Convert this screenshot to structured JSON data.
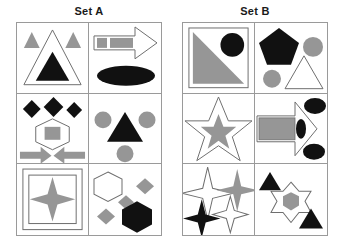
{
  "colors": {
    "black": "#111111",
    "gray": "#969696",
    "white": "#ffffff",
    "stroke": "#6e6e6e",
    "grid_line": "#9a9a9a",
    "title_text": "#1a1a1a",
    "background": "#ffffff"
  },
  "sets": [
    {
      "id": "set-a",
      "title": "Set A",
      "cells": [
        {
          "position": "row1-col1",
          "shapes": [
            "gray-triangle-small-left",
            "gray-triangle-small-right",
            "white-triangle-large-outline",
            "black-triangle-medium"
          ]
        },
        {
          "position": "row1-col2",
          "shapes": [
            "white-arrow-right-outline",
            "gray-rectangle-small",
            "gray-rectangle-wide",
            "black-ellipse"
          ]
        },
        {
          "position": "row2-col1",
          "shapes": [
            "black-diamond-left",
            "black-diamond-top",
            "black-diamond-right",
            "white-hexagon-outline",
            "gray-square",
            "gray-arrow-right",
            "gray-arrow-left"
          ]
        },
        {
          "position": "row2-col2",
          "shapes": [
            "gray-circle-left",
            "gray-circle-right",
            "black-triangle-large",
            "gray-circle-bottom"
          ]
        },
        {
          "position": "row3-col1",
          "shapes": [
            "white-square-outline-outer",
            "white-square-outline-inner",
            "gray-four-point-star"
          ]
        },
        {
          "position": "row3-col2",
          "shapes": [
            "white-hexagon-outline",
            "gray-diamond-right",
            "gray-diamond-center",
            "gray-diamond-left",
            "black-hexagon"
          ]
        }
      ]
    },
    {
      "id": "set-b",
      "title": "Set B",
      "cells": [
        {
          "position": "row1-col1",
          "shapes": [
            "white-square-outline",
            "gray-right-triangle",
            "black-circle"
          ]
        },
        {
          "position": "row1-col2",
          "shapes": [
            "black-pentagon",
            "gray-circle-right",
            "gray-circle-left",
            "white-triangle-outline"
          ]
        },
        {
          "position": "row2-col1",
          "shapes": [
            "white-five-point-star-outline",
            "gray-five-point-star"
          ]
        },
        {
          "position": "row2-col2",
          "shapes": [
            "white-arrow-right-outline",
            "gray-rectangle",
            "black-ellipse-top",
            "black-ellipse-middle",
            "black-ellipse-bottom"
          ]
        },
        {
          "position": "row3-col1",
          "shapes": [
            "white-four-point-star-outline",
            "gray-four-point-star",
            "black-four-point-star",
            "white-four-point-star-small-outline"
          ]
        },
        {
          "position": "row3-col2",
          "shapes": [
            "black-triangle-top-left",
            "white-six-point-star-outline",
            "gray-hexagon",
            "black-triangle-bottom-right"
          ]
        }
      ]
    }
  ]
}
